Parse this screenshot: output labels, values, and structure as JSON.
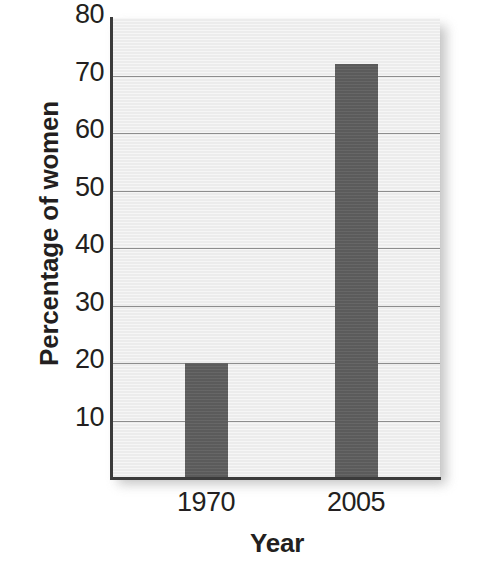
{
  "chart_data": {
    "type": "bar",
    "title": "",
    "categories": [
      "1970",
      "2005"
    ],
    "values": [
      20,
      72
    ],
    "series": [
      {
        "name": "Percentage of women",
        "values": [
          20,
          72
        ]
      }
    ],
    "xlabel": "Year",
    "ylabel": "Percentage of women",
    "ylim": [
      0,
      80
    ],
    "ytick_values": [
      10,
      20,
      30,
      40,
      50,
      60,
      70,
      80
    ],
    "ytick_labels": [
      "10",
      "20",
      "30",
      "40",
      "50",
      "60",
      "70",
      "80"
    ],
    "xtick_labels": [
      "1970",
      "2005"
    ],
    "grid": "horizontal",
    "legend": "none",
    "bar_color": "#5b5b5b",
    "plot_background_color": "#ececec",
    "axis_color": "#3b3b3b",
    "gridline_color": "#8d8d8d",
    "text_color": "#231f20"
  }
}
